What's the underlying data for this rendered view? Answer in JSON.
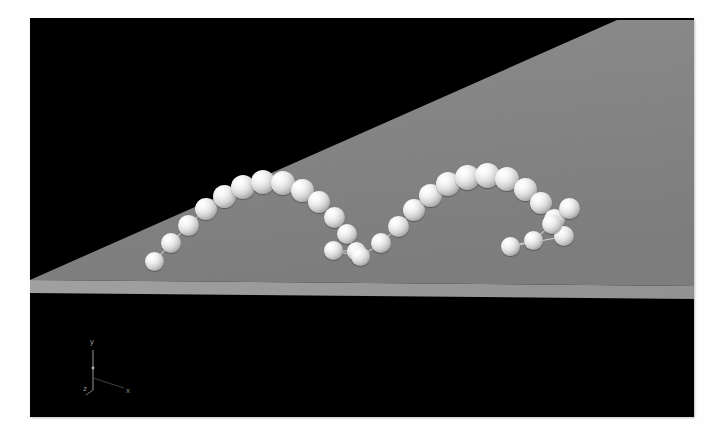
{
  "scene": {
    "title": "Bouncing Ball Trajectory",
    "description": "3D rendered simulation of a ball bouncing along an inclined gray plane, sampled at regular time steps and drawn as a chain of connected white spheres.",
    "background_color": "#000000",
    "page_background_color": "#ffffff",
    "surface_color": "#878787",
    "floor_strip_color": "#9a9a9a",
    "ball_color": "#f2f2f2",
    "link_color": "#ebebeb",
    "viewport": {
      "x": 30,
      "y": 18,
      "width": 664,
      "height": 399
    }
  },
  "axis_triad": {
    "name": "coordinate-axis-indicator",
    "color": "#8d8d8d",
    "labels": {
      "x": "x",
      "y": "y",
      "z": "z"
    }
  },
  "geometry": {
    "wedge_polygon": "0,262 587,2 664,2 664,268",
    "floor_polygon": "0,262 664,268 664,280 0,274",
    "wedge_apex": {
      "x": 0,
      "y": 262
    },
    "wedge_top_right": {
      "x": 587,
      "y": 2
    }
  },
  "chart_data": {
    "type": "scatter",
    "xlabel": "x",
    "ylabel": "y",
    "zlabel": "z",
    "series": [
      {
        "name": "ball-positions",
        "note": "screen-space pixel centers within the viewport, radius in px",
        "points": [
          {
            "x": 124,
            "y": 243,
            "r": 9.5
          },
          {
            "x": 141,
            "y": 225,
            "r": 10.0
          },
          {
            "x": 158,
            "y": 207,
            "r": 10.5
          },
          {
            "x": 176,
            "y": 191,
            "r": 11.0
          },
          {
            "x": 194,
            "y": 178,
            "r": 11.5
          },
          {
            "x": 213,
            "y": 169,
            "r": 12.0
          },
          {
            "x": 233,
            "y": 164,
            "r": 12.0
          },
          {
            "x": 253,
            "y": 165,
            "r": 12.0
          },
          {
            "x": 272,
            "y": 172,
            "r": 11.5
          },
          {
            "x": 289,
            "y": 184,
            "r": 11.0
          },
          {
            "x": 304,
            "y": 199,
            "r": 10.5
          },
          {
            "x": 317,
            "y": 216,
            "r": 10.0
          },
          {
            "x": 326,
            "y": 233,
            "r": 9.5
          },
          {
            "x": 303,
            "y": 232,
            "r": 9.5
          },
          {
            "x": 330,
            "y": 238,
            "r": 9.5
          },
          {
            "x": 351,
            "y": 225,
            "r": 10.0
          },
          {
            "x": 368,
            "y": 208,
            "r": 10.5
          },
          {
            "x": 384,
            "y": 192,
            "r": 11.0
          },
          {
            "x": 400,
            "y": 177,
            "r": 11.5
          },
          {
            "x": 418,
            "y": 166,
            "r": 12.0
          },
          {
            "x": 437,
            "y": 159,
            "r": 12.5
          },
          {
            "x": 457,
            "y": 157,
            "r": 12.5
          },
          {
            "x": 477,
            "y": 161,
            "r": 12.0
          },
          {
            "x": 495,
            "y": 171,
            "r": 11.5
          },
          {
            "x": 511,
            "y": 185,
            "r": 11.0
          },
          {
            "x": 524,
            "y": 201,
            "r": 10.5
          },
          {
            "x": 534,
            "y": 218,
            "r": 10.0
          },
          {
            "x": 480,
            "y": 228,
            "r": 9.5
          },
          {
            "x": 503,
            "y": 222,
            "r": 9.5
          },
          {
            "x": 522,
            "y": 206,
            "r": 10.0
          },
          {
            "x": 539,
            "y": 190,
            "r": 10.5
          }
        ]
      }
    ],
    "links": [
      [
        0,
        1
      ],
      [
        1,
        2
      ],
      [
        2,
        3
      ],
      [
        3,
        4
      ],
      [
        4,
        5
      ],
      [
        5,
        6
      ],
      [
        6,
        7
      ],
      [
        7,
        8
      ],
      [
        8,
        9
      ],
      [
        9,
        10
      ],
      [
        10,
        11
      ],
      [
        11,
        12
      ],
      [
        12,
        13
      ],
      [
        13,
        14
      ],
      [
        14,
        15
      ],
      [
        15,
        16
      ],
      [
        16,
        17
      ],
      [
        17,
        18
      ],
      [
        18,
        19
      ],
      [
        19,
        20
      ],
      [
        20,
        21
      ],
      [
        21,
        22
      ],
      [
        22,
        23
      ],
      [
        23,
        24
      ],
      [
        24,
        25
      ],
      [
        25,
        26
      ],
      [
        26,
        27
      ],
      [
        27,
        28
      ],
      [
        28,
        29
      ],
      [
        29,
        30
      ]
    ],
    "grid": false,
    "legend": "none"
  }
}
